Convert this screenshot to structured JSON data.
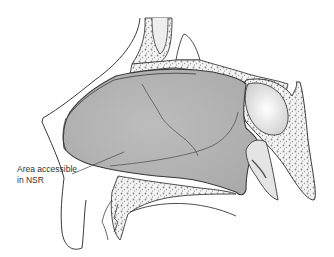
{
  "figure": {
    "type": "anatomical sagittal section of nasal cavity",
    "annotation": {
      "line1": "Area accessible",
      "line2": "in NSR"
    },
    "colors": {
      "shaded_region": "#b4b4b4",
      "outline": "#3a3a3a",
      "bone_fill": "#f2f2f2",
      "bone_speckle": "#7a7a7a",
      "background": "#ffffff"
    }
  }
}
